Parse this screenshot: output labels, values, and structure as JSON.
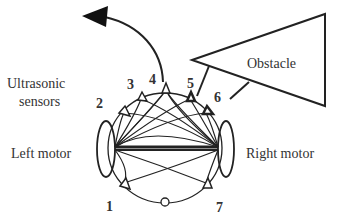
{
  "diagram": {
    "title_labels": {
      "ultrasonic_line1": "Ultrasonic",
      "ultrasonic_line2": "sensors",
      "left_motor": "Left motor",
      "right_motor": "Right motor",
      "obstacle": "Obstacle"
    },
    "sensors": [
      {
        "id": "1",
        "label": "1"
      },
      {
        "id": "2",
        "label": "2"
      },
      {
        "id": "3",
        "label": "3"
      },
      {
        "id": "4",
        "label": "4"
      },
      {
        "id": "5",
        "label": "5"
      },
      {
        "id": "6",
        "label": "6"
      },
      {
        "id": "7",
        "label": "7"
      }
    ],
    "colors": {
      "stroke": "#222222",
      "text": "#333333",
      "background": "#ffffff"
    }
  }
}
